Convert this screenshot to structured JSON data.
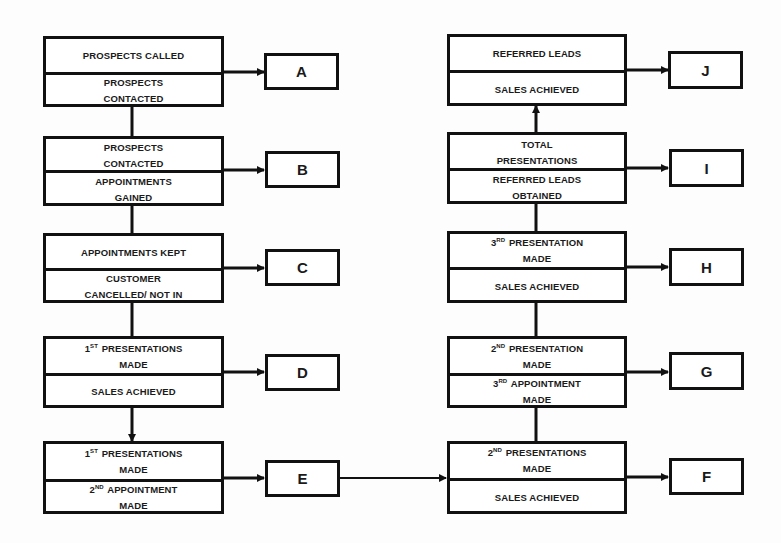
{
  "diagram": {
    "left_column": [
      {
        "id": "stage-1",
        "top_text": "PROSPECTS CALLED",
        "bottom_text": "PROSPECTS CONTACTED",
        "result": "A"
      },
      {
        "id": "stage-2",
        "top_text": "PROSPECTS CONTACTED",
        "bottom_text": "APPOINTMENTS GAINED",
        "result": "B"
      },
      {
        "id": "stage-3",
        "top_text": "APPOINTMENTS KEPT",
        "bottom_text": "CUSTOMER CANCELLED/ NOT IN",
        "result": "C"
      },
      {
        "id": "stage-4",
        "top_ord": "1",
        "top_sup": "ST",
        "top_text": "PRESENTATIONS MADE",
        "bottom_text": "SALES ACHIEVED",
        "result": "D"
      },
      {
        "id": "stage-5",
        "top_ord": "1",
        "top_sup": "ST",
        "top_text": "PRESENTATIONS MADE",
        "bottom_ord": "2",
        "bottom_sup": "ND",
        "bottom_text": "APPOINTMENT MADE",
        "result": "E"
      }
    ],
    "right_column": [
      {
        "id": "stage-6",
        "top_ord": "2",
        "top_sup": "ND",
        "top_text": "PRESENTATIONS MADE",
        "bottom_text": "SALES ACHIEVED",
        "result": "F"
      },
      {
        "id": "stage-7",
        "top_ord": "2",
        "top_sup": "ND",
        "top_text": "PRESENTATION MADE",
        "bottom_ord": "3",
        "bottom_sup": "RD",
        "bottom_text": "APPOINTMENT MADE",
        "result": "G"
      },
      {
        "id": "stage-8",
        "top_ord": "3",
        "top_sup": "RD",
        "top_text": "PRESENTATION MADE",
        "bottom_text": "SALES ACHIEVED",
        "result": "H"
      },
      {
        "id": "stage-9",
        "top_text": "TOTAL PRESENTATIONS",
        "bottom_text": "REFERRED LEADS OBTAINED",
        "result": "I"
      },
      {
        "id": "stage-10",
        "top_text": "REFERRED LEADS",
        "bottom_text": "SALES ACHIEVED",
        "result": "J"
      }
    ],
    "colors": {
      "line": "#111111",
      "background": "#ffffff",
      "text": "#1a1a1a"
    }
  }
}
